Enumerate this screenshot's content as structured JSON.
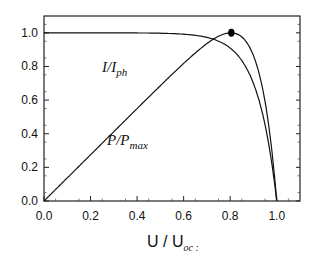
{
  "chart_data": {
    "type": "line",
    "title": "",
    "xlabel": "U / U_oc",
    "ylabel": "",
    "xlim": [
      0.0,
      1.1
    ],
    "ylim": [
      0.0,
      1.1
    ],
    "x_ticks": [
      "0.0",
      "0.2",
      "0.4",
      "0.6",
      "0.8",
      "1.0"
    ],
    "y_ticks": [
      "0.0",
      "0.2",
      "0.4",
      "0.6",
      "0.8",
      "1.0"
    ],
    "grid": false,
    "series": [
      {
        "name": "I/I_ph",
        "x": [
          0.0,
          0.2,
          0.4,
          0.5,
          0.6,
          0.7,
          0.75,
          0.8,
          0.85,
          0.9,
          0.95,
          0.98,
          1.0
        ],
        "values": [
          1.0,
          0.998,
          0.993,
          0.985,
          0.97,
          0.94,
          0.91,
          0.86,
          0.78,
          0.63,
          0.4,
          0.2,
          0.0
        ]
      },
      {
        "name": "P/P_max",
        "x": [
          0.0,
          0.2,
          0.4,
          0.6,
          0.7,
          0.78,
          0.85,
          0.9,
          0.95,
          0.98,
          1.0
        ],
        "values": [
          0.0,
          0.26,
          0.51,
          0.76,
          0.87,
          0.99,
          0.91,
          0.74,
          0.48,
          0.25,
          0.0
        ]
      }
    ],
    "annotations": [
      {
        "text": "I/I_ph",
        "x": 0.33,
        "y": 0.83
      },
      {
        "text": "P/P_max",
        "x": 0.38,
        "y": 0.45
      },
      {
        "text": "max power point",
        "x": 0.78,
        "y": 0.99,
        "marker": "filled-circle"
      }
    ],
    "labels": {
      "curve_i_main": "I/I",
      "curve_i_sub": "ph",
      "curve_p_main": "P/P",
      "curve_p_sub": "max",
      "x_axis_main": "U / U",
      "x_axis_sub": "oc",
      "x_axis_trail": ":"
    }
  }
}
